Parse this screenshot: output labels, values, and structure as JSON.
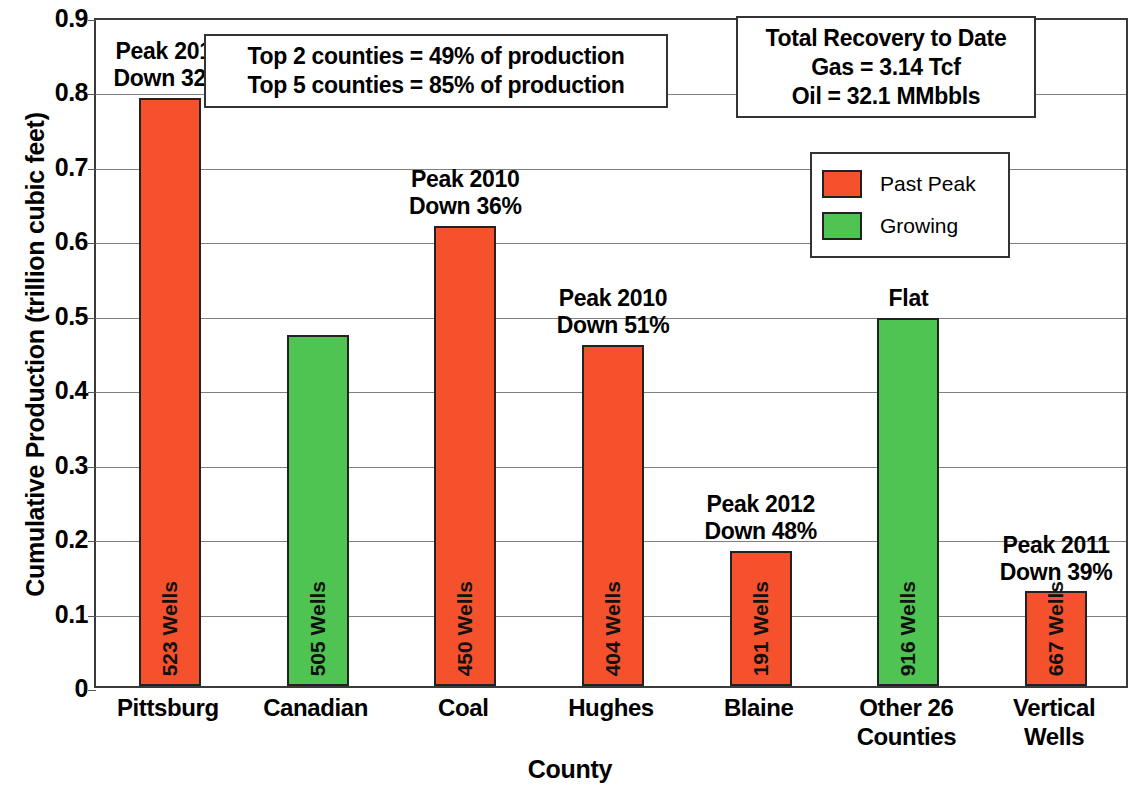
{
  "chart_data": {
    "type": "bar",
    "title": "",
    "xlabel": "County",
    "ylabel": "Cumulative Production (trillion cubic feet)",
    "ylim": [
      0,
      0.9
    ],
    "ytick_labels": [
      "0.9",
      "0.8",
      "0.7",
      "0.6",
      "0.5",
      "0.4",
      "0.3",
      "0.2",
      "0.1",
      "0"
    ],
    "ytick_values": [
      0.9,
      0.8,
      0.7,
      0.6,
      0.5,
      0.4,
      0.3,
      0.2,
      0.1,
      0
    ],
    "grid": true,
    "legend_position": "upper right",
    "categories": [
      "Pittsburg",
      "Canadian",
      "Coal",
      "Hughes",
      "Blaine",
      "Other 26\nCounties",
      "Vertical\nWells"
    ],
    "series": [
      {
        "name": "Cumulative Production",
        "values": [
          0.79,
          0.472,
          0.618,
          0.458,
          0.182,
          0.495,
          0.127
        ]
      }
    ],
    "bars": [
      {
        "category_line1": "Pittsburg",
        "category_line2": "",
        "value": 0.79,
        "status": "Past Peak",
        "color": "#F4512C",
        "wells": "523",
        "wells_unit": "Wells",
        "annotation_line1": "Peak 2012",
        "annotation_line2": "Down 32%"
      },
      {
        "category_line1": "Canadian",
        "category_line2": "",
        "value": 0.472,
        "status": "Growing",
        "color": "#4FC452",
        "wells": "505",
        "wells_unit": "Wells",
        "annotation_line1": "",
        "annotation_line2": ""
      },
      {
        "category_line1": "Coal",
        "category_line2": "",
        "value": 0.618,
        "status": "Past Peak",
        "color": "#F4512C",
        "wells": "450",
        "wells_unit": "Wells",
        "annotation_line1": "Peak 2010",
        "annotation_line2": "Down 36%"
      },
      {
        "category_line1": "Hughes",
        "category_line2": "",
        "value": 0.458,
        "status": "Past Peak",
        "color": "#F4512C",
        "wells": "404",
        "wells_unit": "Wells",
        "annotation_line1": "Peak 2010",
        "annotation_line2": "Down 51%"
      },
      {
        "category_line1": "Blaine",
        "category_line2": "",
        "value": 0.182,
        "status": "Past Peak",
        "color": "#F4512C",
        "wells": "191",
        "wells_unit": "Wells",
        "annotation_line1": "Peak 2012",
        "annotation_line2": "Down 48%"
      },
      {
        "category_line1": "Other 26",
        "category_line2": "Counties",
        "value": 0.495,
        "status": "Growing",
        "color": "#4FC452",
        "wells": "916",
        "wells_unit": "Wells",
        "annotation_line1": "Flat",
        "annotation_line2": ""
      },
      {
        "category_line1": "Vertical",
        "category_line2": "Wells",
        "value": 0.127,
        "status": "Past Peak",
        "color": "#F4512C",
        "wells": "667",
        "wells_unit": "Wells",
        "annotation_line1": "Peak 2011",
        "annotation_line2": "Down 39%"
      }
    ],
    "annotations": [
      {
        "id": "counties-share",
        "line1": "Top 2 counties = 49% of production",
        "line2": "Top 5 counties = 85% of production"
      },
      {
        "id": "total-recovery",
        "line1": "Total Recovery to Date",
        "line2": "Gas = 3.14 Tcf",
        "line3": "Oil = 32.1 MMbbls"
      }
    ],
    "legend": [
      {
        "label": "Past Peak",
        "color": "#F4512C"
      },
      {
        "label": "Growing",
        "color": "#4FC452"
      }
    ],
    "colors": {
      "past_peak": "#F4512C",
      "growing": "#4FC452",
      "gridline": "#808080",
      "axis": "#3a3a3a",
      "text": "#000000"
    }
  }
}
